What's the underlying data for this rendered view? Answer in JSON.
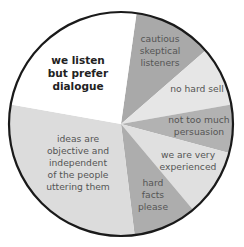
{
  "chart_data": {
    "type": "pie",
    "title": "",
    "center": [
      121,
      124
    ],
    "radius": 112,
    "outline_color": "#1a1a1a",
    "slices": [
      {
        "label": "cautious skeptical listeners",
        "lines": [
          "cautious",
          "skeptical",
          "listeners"
        ],
        "start_deg": 8,
        "end_deg": 49,
        "color": "#a9a9a9",
        "bold": false,
        "label_pos": [
          160,
          42
        ]
      },
      {
        "label": "no hard sell",
        "lines": [
          "no hard sell"
        ],
        "start_deg": 49,
        "end_deg": 80,
        "color": "#e6e6e6",
        "bold": false,
        "label_pos": [
          197,
          92
        ]
      },
      {
        "label": "not too much persuasion",
        "lines": [
          "not too much",
          "persuasion"
        ],
        "start_deg": 80,
        "end_deg": 105,
        "color": "#b2b2b2",
        "bold": false,
        "label_pos": [
          199,
          123
        ]
      },
      {
        "label": "we are very experienced",
        "lines": [
          "we are very",
          "experienced"
        ],
        "start_deg": 105,
        "end_deg": 140,
        "color": "#e0e0e0",
        "bold": false,
        "label_pos": [
          188,
          158
        ]
      },
      {
        "label": "hard facts please",
        "lines": [
          "hard",
          "facts",
          "please"
        ],
        "start_deg": 140,
        "end_deg": 173,
        "color": "#adadad",
        "bold": false,
        "label_pos": [
          153,
          186
        ]
      },
      {
        "label": "ideas are objective and independent of the people uttering them",
        "lines": [
          "ideas are",
          "objective and",
          "independent",
          "of the people",
          "uttering them"
        ],
        "start_deg": 173,
        "end_deg": 280,
        "color": "#dcdcdc",
        "bold": false,
        "label_pos": [
          78,
          142
        ]
      },
      {
        "label": "we listen but prefer dialogue",
        "lines": [
          "we listen",
          "but prefer",
          "dialogue"
        ],
        "start_deg": 280,
        "end_deg": 368,
        "color": "#ffffff",
        "bold": true,
        "label_pos": [
          78,
          64
        ]
      }
    ],
    "values_deg": [
      41,
      31,
      25,
      35,
      33,
      107,
      88
    ],
    "legend": "none",
    "grid": false
  }
}
